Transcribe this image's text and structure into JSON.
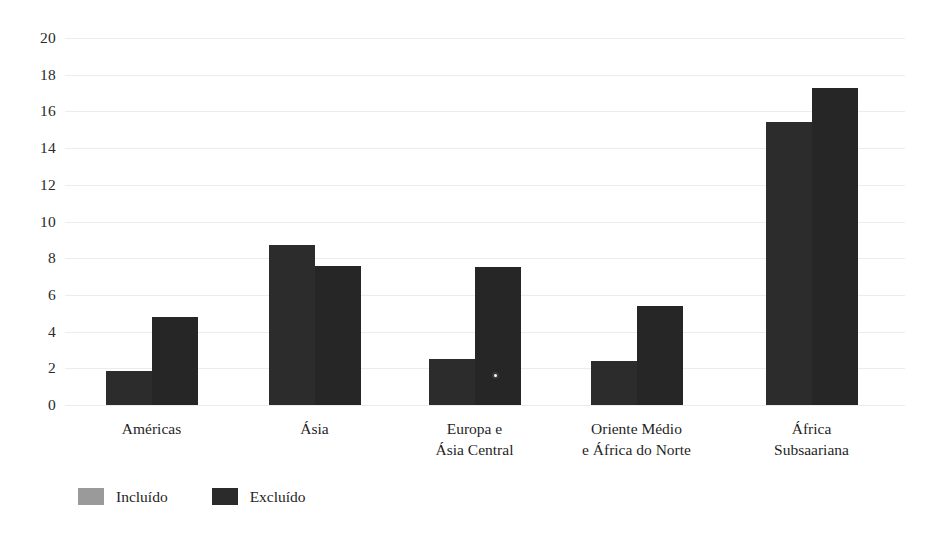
{
  "chart_data": {
    "type": "bar",
    "title": "",
    "subtitle": "",
    "xlabel": "",
    "ylabel": "",
    "ylim": [
      0,
      20
    ],
    "ytick_step": 2,
    "yticks": [
      "20",
      "18",
      "16",
      "14",
      "12",
      "10",
      "8",
      "6",
      "4",
      "2",
      "0"
    ],
    "grid": true,
    "legend_position": "bottom-left",
    "categories": [
      "Américas",
      "Ásia",
      "Europa e\nÁsia Central",
      "Oriente Médio\ne África do Norte",
      "África\nSubsaariana"
    ],
    "series": [
      {
        "name": "Incluído",
        "color": "#2c2c2c",
        "legend_swatch_color": "#9a9a9a",
        "values": [
          1.85,
          8.7,
          2.5,
          2.4,
          15.4
        ]
      },
      {
        "name": "Excluído",
        "color": "#262626",
        "legend_swatch_color": "#2b2b2b",
        "values": [
          4.8,
          7.6,
          7.5,
          5.4,
          17.3
        ]
      }
    ]
  },
  "legend": {
    "items": [
      {
        "label": "Incluído",
        "color": "#9a9a9a"
      },
      {
        "label": "Excluído",
        "color": "#2b2b2b"
      }
    ]
  },
  "axis": {
    "grid_color": "#ececec",
    "tick_text_color": "#2a2a2a"
  }
}
